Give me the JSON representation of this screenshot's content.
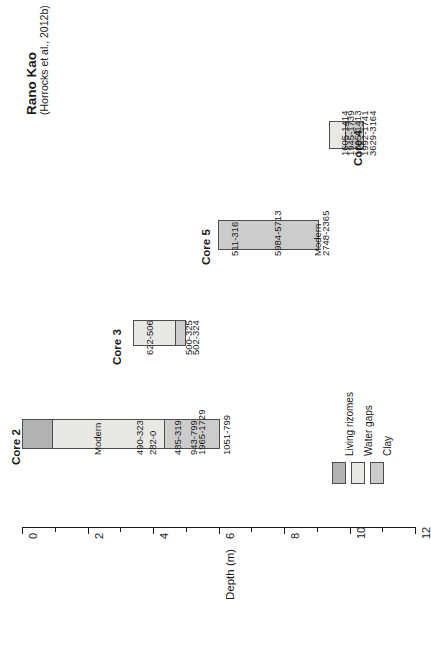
{
  "figure": {
    "title": "Rano Kao",
    "subtitle": "(Horrocks et al., 2012b)"
  },
  "chart_data": {
    "type": "bar",
    "title": "Rano Kao",
    "subtitle": "(Horrocks et al., 2012b)",
    "orientation": "horizontal-rotated",
    "xlabel": "",
    "ylabel": "Depth (m)",
    "axis_label": "Depth (m)",
    "ylim": [
      0,
      12
    ],
    "axis_ticks_major": [
      "0",
      "2",
      "4",
      "6",
      "8",
      "10",
      "12"
    ],
    "axis_tick_step_minor": 1,
    "grid": false,
    "legend_position": "bottom-right",
    "colors": {
      "living_rizomes": "#b3b3b3",
      "water_gaps": "#e8e8e4",
      "clay": "#cccccc",
      "outline": "#4d4d4d",
      "text": "#1a1a1a",
      "background": "#ffffff"
    },
    "legend": [
      {
        "key": "living_rizomes",
        "label": "Living rizomes",
        "color": "#b3b3b3"
      },
      {
        "key": "water_gaps",
        "label": "Water gaps",
        "color": "#e8e8e4"
      },
      {
        "key": "clay",
        "label": "Clay",
        "color": "#cccccc"
      }
    ],
    "cores": [
      {
        "name": "Core 2",
        "depth_start": 0.0,
        "depth_end": 6.05,
        "segments": [
          {
            "type": "living_rizomes",
            "label": "Living rizomes",
            "from": 0.0,
            "to": 0.92
          },
          {
            "type": "water_gaps",
            "label": "Water gaps",
            "from": 0.92,
            "to": 4.37
          },
          {
            "type": "clay",
            "label": "Clay",
            "from": 4.37,
            "to": 6.05
          }
        ],
        "dates": [
          {
            "text": "Modern",
            "depth": 2.0
          },
          {
            "text": "490-323",
            "depth": 3.3
          },
          {
            "text": "282-0",
            "depth": 3.7
          },
          {
            "text": "485-319",
            "depth": 4.45
          },
          {
            "text": "943-799",
            "depth": 4.95
          },
          {
            "text": "1965-1729",
            "depth": 5.2
          },
          {
            "text": "1051-799",
            "depth": 5.95
          }
        ]
      },
      {
        "name": "Core 3",
        "depth_start": 3.38,
        "depth_end": 5.0,
        "segments": [
          {
            "type": "water_gaps",
            "label": "Water gaps",
            "from": 3.38,
            "to": 4.72
          },
          {
            "type": "clay",
            "label": "Clay",
            "from": 4.72,
            "to": 5.0
          }
        ],
        "dates": [
          {
            "text": "622-506",
            "depth": 3.6
          },
          {
            "text": "500-325",
            "depth": 4.78
          },
          {
            "text": "502-324",
            "depth": 5.0
          }
        ]
      },
      {
        "name": "Core 5",
        "depth_start": 5.98,
        "depth_end": 9.08,
        "segments": [
          {
            "type": "clay",
            "label": "Clay",
            "from": 5.98,
            "to": 9.08
          }
        ],
        "dates": [
          {
            "text": "511-316",
            "depth": 6.2
          },
          {
            "text": "5984-5713",
            "depth": 7.5
          },
          {
            "text": "Modern",
            "depth": 8.72
          },
          {
            "text": "2748-2365",
            "depth": 8.98
          }
        ]
      },
      {
        "name": "Core 4",
        "depth_start": 9.38,
        "depth_end": 10.45,
        "segments": [
          {
            "type": "water_gaps",
            "label": "Water gaps",
            "from": 9.38,
            "to": 9.9
          },
          {
            "type": "clay",
            "label": "Clay",
            "from": 9.9,
            "to": 10.45
          }
        ],
        "dates": [
          {
            "text": "1605-1414",
            "depth": 9.55
          },
          {
            "text": "1945-1739",
            "depth": 9.75
          },
          {
            "text": "1605-1413",
            "depth": 9.95
          },
          {
            "text": "1992-1741",
            "depth": 10.17
          },
          {
            "text": "3629-3164",
            "depth": 10.4
          }
        ]
      }
    ]
  }
}
